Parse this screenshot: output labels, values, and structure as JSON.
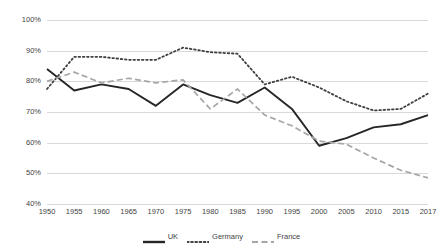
{
  "chart_data": {
    "type": "line",
    "title": "",
    "xlabel": "",
    "ylabel": "",
    "x": [
      1950,
      1955,
      1960,
      1965,
      1970,
      1975,
      1980,
      1985,
      1990,
      1995,
      2000,
      2005,
      2010,
      2015,
      2017
    ],
    "xtick_labels": [
      "1950",
      "1955",
      "1960",
      "1965",
      "1970",
      "1975",
      "1980",
      "1985",
      "1990",
      "1995",
      "2000",
      "2005",
      "2010",
      "2015",
      "2017"
    ],
    "ytick_labels": [
      "100%",
      "90%",
      "80%",
      "70%",
      "60%",
      "50%",
      "40%"
    ],
    "ytick_values": [
      100,
      90,
      80,
      70,
      60,
      50,
      40
    ],
    "ylim": [
      40,
      100
    ],
    "grid": true,
    "legend_position": "bottom",
    "series": [
      {
        "name": "UK",
        "style": "solid",
        "color": "#262626",
        "values": [
          84.0,
          77.0,
          79.0,
          77.5,
          72.0,
          79.0,
          75.5,
          73.0,
          78.0,
          71.0,
          59.0,
          61.5,
          65.0,
          66.0,
          69.0
        ]
      },
      {
        "name": "Germany",
        "style": "dotted",
        "color": "#3f3f3f",
        "values": [
          77.5,
          88.0,
          88.0,
          87.0,
          87.0,
          91.0,
          89.5,
          89.0,
          79.0,
          81.5,
          78.0,
          73.5,
          70.5,
          71.0,
          76.0
        ]
      },
      {
        "name": "France",
        "style": "dashed",
        "color": "#a6a6a6",
        "values": [
          80.0,
          83.0,
          79.5,
          81.0,
          79.5,
          80.5,
          71.0,
          77.5,
          69.0,
          65.5,
          60.5,
          59.5,
          55.0,
          51.0,
          48.5
        ]
      }
    ]
  },
  "legend": {
    "items": [
      {
        "label": "UK"
      },
      {
        "label": "Germany"
      },
      {
        "label": "France"
      }
    ]
  }
}
